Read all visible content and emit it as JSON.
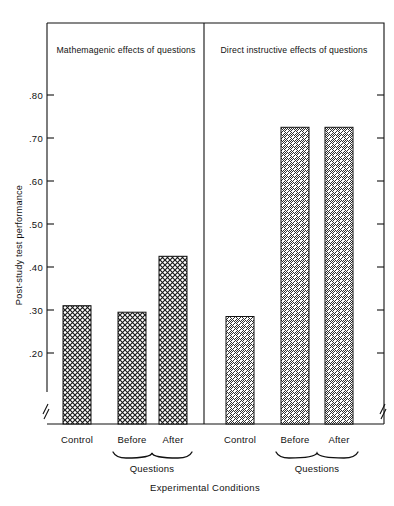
{
  "chart_data": {
    "type": "bar",
    "title": "",
    "xlabel": "Experimental Conditions",
    "ylabel": "Post-study test performance",
    "ylim": [
      0.155,
      0.855
    ],
    "grid": false,
    "legend": "none",
    "y_axis_break": true,
    "yticks": [
      ".20",
      ".30",
      ".40",
      ".50",
      ".60",
      ".70",
      ".80"
    ],
    "ytick_values": [
      0.2,
      0.3,
      0.4,
      0.5,
      0.6,
      0.7,
      0.8
    ],
    "panels": [
      {
        "title": "Mathemagenic effects of questions",
        "fill_pattern": "crosshatch",
        "categories": [
          "Control",
          "Before",
          "After"
        ],
        "values": [
          0.31,
          0.295,
          0.425
        ],
        "group_label": "Questions",
        "group_members": [
          "Before",
          "After"
        ]
      },
      {
        "title": "Direct instructive effects of questions",
        "fill_pattern": "diagonal-hatch",
        "categories": [
          "Control",
          "Before",
          "After"
        ],
        "values": [
          0.285,
          0.725,
          0.725
        ],
        "group_label": "Questions",
        "group_members": [
          "Before",
          "After"
        ]
      }
    ],
    "colors": {
      "ink": "#111111",
      "background": "#ffffff",
      "bar_fill": "#ffffff"
    }
  },
  "axis": {
    "ylabel": "Post-study test performance",
    "xlabel": "Experimental Conditions",
    "tick_00": ".80",
    "tick_01": ".70",
    "tick_02": ".60",
    "tick_03": ".50",
    "tick_04": ".40",
    "tick_05": ".30",
    "tick_06": ".20"
  },
  "panel_left": {
    "title": "Mathemagenic effects of questions",
    "cat_control": "Control",
    "cat_before": "Before",
    "cat_after": "After",
    "group_label": "Questions"
  },
  "panel_right": {
    "title": "Direct instructive effects of questions",
    "cat_control": "Control",
    "cat_before": "Before",
    "cat_after": "After",
    "group_label": "Questions"
  }
}
